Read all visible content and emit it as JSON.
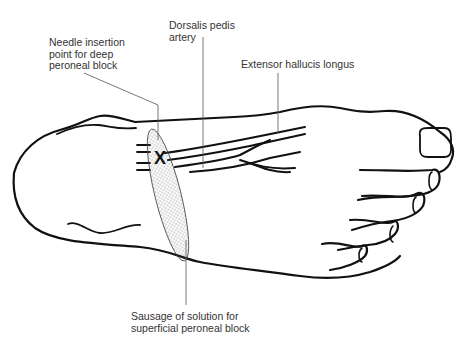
{
  "diagram": {
    "labels": {
      "needle_insertion": "Needle insertion\npoint for deep\nperoneal block",
      "dorsalis_pedis": "Dorsalis pedis\nartery",
      "extensor_hallucis": "Extensor hallucis  longus",
      "sausage": "Sausage of solution for\nsuperficial peroneal block"
    },
    "marker": "X",
    "colors": {
      "outline": "#111111",
      "leader": "#555555",
      "text": "#333333",
      "stipple": "#555555"
    }
  }
}
